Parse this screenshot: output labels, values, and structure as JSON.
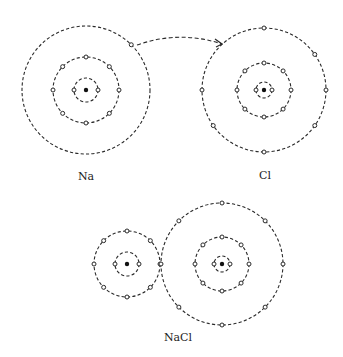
{
  "labels": {
    "na": "Na",
    "cl": "Cl",
    "nacl": "NaCl"
  },
  "atoms": [
    {
      "id": "na-atom",
      "label": "Na",
      "center": [
        86,
        90
      ],
      "shells": [
        {
          "r": 12,
          "electron_angles": [
            0,
            180
          ]
        },
        {
          "r": 33,
          "electron_angles": [
            0,
            45,
            90,
            135,
            180,
            225,
            270,
            315
          ]
        },
        {
          "r": 64,
          "electron_angles": [
            -45
          ]
        }
      ]
    },
    {
      "id": "cl-atom",
      "label": "Cl",
      "center": [
        264,
        90
      ],
      "shells": [
        {
          "r": 8,
          "electron_angles": [
            0,
            180
          ]
        },
        {
          "r": 27,
          "electron_angles": [
            0,
            45,
            90,
            135,
            180,
            225,
            270,
            315
          ]
        },
        {
          "r": 62,
          "electron_angles": [
            -90,
            -35,
            0,
            35,
            90,
            145,
            180
          ]
        }
      ]
    },
    {
      "id": "na-ion",
      "label": "Na+",
      "center": [
        127,
        264
      ],
      "shells": [
        {
          "r": 12,
          "electron_angles": [
            0,
            180
          ]
        },
        {
          "r": 33,
          "electron_angles": [
            0,
            45,
            90,
            135,
            180,
            225,
            270,
            315
          ]
        }
      ]
    },
    {
      "id": "cl-ion",
      "label": "Cl-",
      "center": [
        222,
        264
      ],
      "shells": [
        {
          "r": 8,
          "electron_angles": [
            0,
            180
          ]
        },
        {
          "r": 27,
          "electron_angles": [
            0,
            45,
            90,
            135,
            180,
            225,
            270,
            315
          ]
        },
        {
          "r": 61,
          "electron_angles": [
            -90,
            -45,
            0,
            45,
            90,
            135,
            180,
            -135
          ]
        }
      ]
    }
  ],
  "transfer_arrow": {
    "from": [
      137,
      45
    ],
    "control": [
      180,
      30
    ],
    "to": [
      222,
      44
    ]
  },
  "colors": {
    "stroke": "#2a2a2a",
    "background": "#ffffff"
  }
}
